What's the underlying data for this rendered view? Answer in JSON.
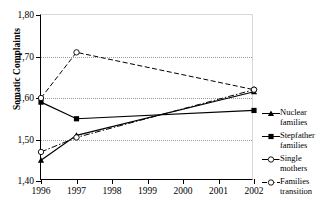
{
  "top_cropped_text": "",
  "axes": {
    "ylabel": "Somatic Complaints",
    "yticks": [
      "1,80",
      "1,70",
      "1,60",
      "1,50",
      "1,40"
    ],
    "xticks": [
      "1996",
      "1997",
      "1998",
      "1999",
      "2000",
      "2001",
      "2002"
    ]
  },
  "legend": {
    "items": [
      {
        "label_line1": "Nuclear",
        "label_line2": "families",
        "marker": "filled-triangle",
        "line": "solid"
      },
      {
        "label_line1": "Stepfather",
        "label_line2": "families",
        "marker": "filled-square",
        "line": "solid"
      },
      {
        "label_line1": "Single",
        "label_line2": "mothers",
        "marker": "open-circle",
        "line": "dash-dot"
      },
      {
        "label_line1": "Families",
        "label_line2": "transition",
        "marker": "open-circle",
        "line": "dashed"
      }
    ]
  },
  "chart_data": {
    "type": "line",
    "title": "",
    "xlabel": "",
    "ylabel": "Somatic Complaints",
    "x": [
      1996,
      1997,
      2002
    ],
    "categories": [
      "1996",
      "1997",
      "1998",
      "1999",
      "2000",
      "2001",
      "2002"
    ],
    "xlim": [
      1996,
      2002
    ],
    "ylim": [
      1.4,
      1.8
    ],
    "ytick_values": [
      1.8,
      1.7,
      1.6,
      1.5,
      1.4
    ],
    "grid": "horizontal-dotted",
    "legend_position": "right",
    "decimal_separator": ",",
    "series": [
      {
        "name": "Nuclear families",
        "marker": "filled-triangle",
        "line": "solid",
        "x": [
          1996,
          1997,
          2002
        ],
        "values": [
          1.45,
          1.51,
          1.615
        ]
      },
      {
        "name": "Stepfather families",
        "marker": "filled-square",
        "line": "solid",
        "x": [
          1996,
          1997,
          2002
        ],
        "values": [
          1.59,
          1.55,
          1.57
        ]
      },
      {
        "name": "Single mothers",
        "marker": "open-circle",
        "line": "dash-dot",
        "x": [
          1996,
          1997,
          2002
        ],
        "values": [
          1.47,
          1.505,
          1.62
        ]
      },
      {
        "name": "Families transition",
        "marker": "open-circle",
        "line": "dashed",
        "x": [
          1996,
          1997,
          2002
        ],
        "values": [
          1.6,
          1.71,
          1.62
        ]
      }
    ]
  },
  "colors": {
    "ink": "#000000",
    "grid": "#9a9a9a",
    "frame": "#d8d8d8",
    "background": "#ffffff"
  }
}
